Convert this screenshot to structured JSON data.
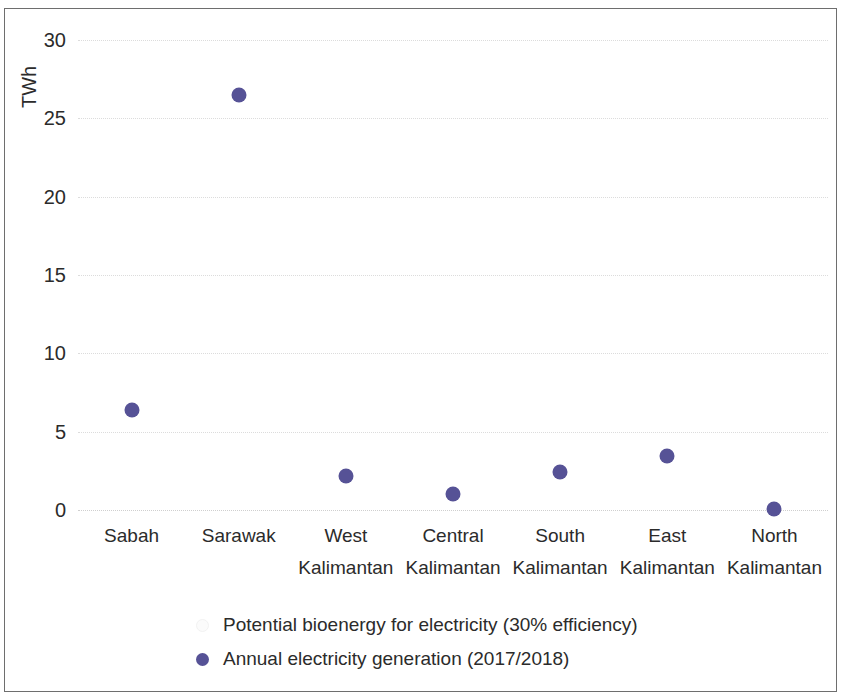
{
  "chart_data": {
    "type": "scatter",
    "title": "",
    "xlabel": "",
    "ylabel": "TWh",
    "ylim": [
      0,
      30
    ],
    "yticks": [
      0,
      5,
      10,
      15,
      20,
      25,
      30
    ],
    "grid": true,
    "legend_position": "bottom",
    "categories": [
      "Sabah",
      "Sarawak",
      "West Kalimantan",
      "Central Kalimantan",
      "South Kalimantan",
      "East Kalimantan",
      "North Kalimantan"
    ],
    "category_lines": [
      {
        "line1": "Sabah",
        "line2": ""
      },
      {
        "line1": "Sarawak",
        "line2": ""
      },
      {
        "line1": "West",
        "line2": "Kalimantan"
      },
      {
        "line1": "Central",
        "line2": "Kalimantan"
      },
      {
        "line1": "South",
        "line2": "Kalimantan"
      },
      {
        "line1": "East",
        "line2": "Kalimantan"
      },
      {
        "line1": "North",
        "line2": "Kalimantan"
      }
    ],
    "series": [
      {
        "name": "Potential bioenergy for electricity (30% efficiency)",
        "marker": "bar",
        "color": "#fbfbfb",
        "values": [
          null,
          null,
          null,
          null,
          null,
          null,
          null
        ]
      },
      {
        "name": "Annual electricity generation (2017/2018)",
        "marker": "circle",
        "color": "#565296",
        "values": [
          6.4,
          26.5,
          2.2,
          1.0,
          2.45,
          3.45,
          0.05
        ]
      }
    ]
  },
  "axes": {
    "y_title": "TWh",
    "y_tick_labels": [
      "30",
      "25",
      "20",
      "15",
      "10",
      "5",
      "0"
    ]
  },
  "legend": {
    "entries": [
      {
        "label": "Potential bioenergy for electricity (30% efficiency)",
        "color": "#fbfbfb",
        "marker": "bar"
      },
      {
        "label": "Annual electricity generation (2017/2018)",
        "color": "#565296",
        "marker": "circle"
      }
    ]
  }
}
